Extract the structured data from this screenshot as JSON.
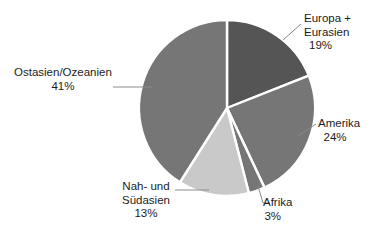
{
  "chart_data": {
    "type": "pie",
    "title": "",
    "categories": [
      "Europa + Eurasien",
      "Amerika",
      "Afrika",
      "Nah- und Südasien",
      "Ostasien/Ozeanien"
    ],
    "values": [
      19,
      24,
      3,
      13,
      41
    ],
    "value_unit": "%",
    "legend": "none",
    "grid": false,
    "start_angle_deg": 0,
    "direction": "clockwise",
    "slice_separator_color": "#ffffff",
    "background": "#ffffff",
    "slices": [
      {
        "label": "Europa + Eurasien",
        "label_lines": [
          "Europa +",
          "Eurasien"
        ],
        "value": 19,
        "value_text": "19%",
        "color": "#555555",
        "leader_line": true
      },
      {
        "label": "Amerika",
        "label_lines": [
          "Amerika"
        ],
        "value": 24,
        "value_text": "24%",
        "color": "#767676",
        "leader_line": true
      },
      {
        "label": "Afrika",
        "label_lines": [
          "Afrika"
        ],
        "value": 3,
        "value_text": "3%",
        "color": "#767676",
        "leader_line": true
      },
      {
        "label": "Nah- und Südasien",
        "label_lines": [
          "Nah- und",
          "Südasien"
        ],
        "value": 13,
        "value_text": "13%",
        "color": "#c9c9c9",
        "leader_line": true
      },
      {
        "label": "Ostasien/Ozeanien",
        "label_lines": [
          "Ostasien/Ozeanien"
        ],
        "value": 41,
        "value_text": "41%",
        "color": "#767676",
        "leader_line": true
      }
    ]
  },
  "geometry": {
    "center_x": 227,
    "center_y": 108,
    "radius": 88,
    "leader_color": "#8a8a8a"
  }
}
